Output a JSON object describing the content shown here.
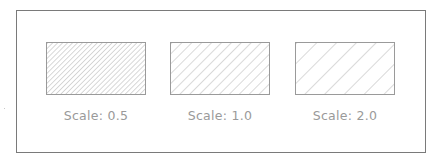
{
  "figure": {
    "colors": {
      "frame": "#7a7a7a",
      "hatch": "#a0a0a0",
      "label": "#9a9a9a",
      "background": "#ffffff"
    },
    "swatches": [
      {
        "label": "Scale: 0.5",
        "scale": 0.5,
        "spacing_px": 3.5
      },
      {
        "label": "Scale: 1.0",
        "scale": 1.0,
        "spacing_px": 7
      },
      {
        "label": "Scale: 2.0",
        "scale": 2.0,
        "spacing_px": 14
      }
    ]
  }
}
